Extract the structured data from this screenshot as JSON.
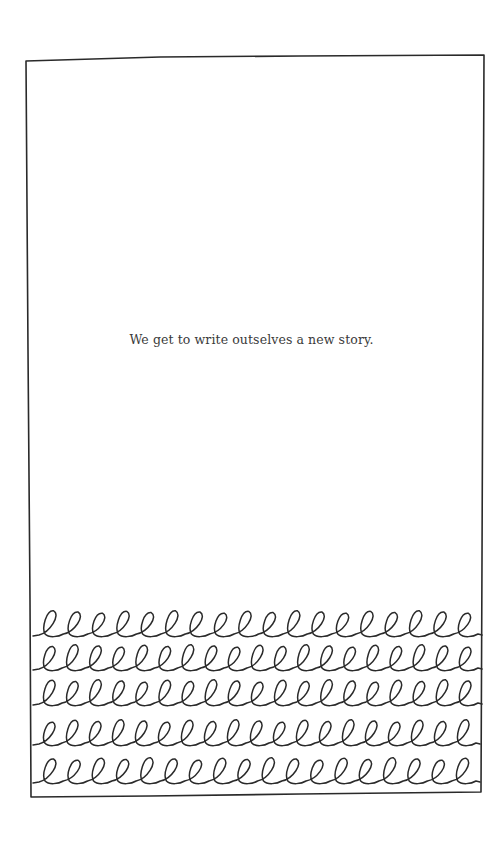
{
  "page": {
    "caption": "We get to write outselves a new story.",
    "ink_color": "#2a2a2a",
    "background_color": "#ffffff"
  },
  "frame": {
    "corners": {
      "top_left": [
        26,
        61
      ],
      "top_right": [
        484,
        55
      ],
      "bottom_right": [
        481,
        792
      ],
      "bottom_left": [
        31,
        797
      ]
    }
  },
  "loop_rows": [
    {
      "baseline": 636,
      "x_start": 33,
      "x_end": 482,
      "loops": 18
    },
    {
      "baseline": 670,
      "x_start": 33,
      "x_end": 482,
      "loops": 19
    },
    {
      "baseline": 705,
      "x_start": 33,
      "x_end": 482,
      "loops": 19
    },
    {
      "baseline": 745,
      "x_start": 33,
      "x_end": 480,
      "loops": 19
    },
    {
      "baseline": 783,
      "x_start": 33,
      "x_end": 480,
      "loops": 18
    }
  ]
}
